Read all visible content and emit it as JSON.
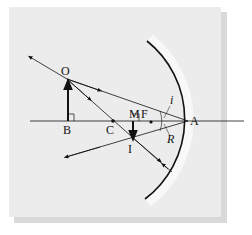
{
  "diagram": {
    "labels": {
      "object_top": "O",
      "object_base": "B",
      "center": "C",
      "image_base": "M",
      "focus": "F",
      "vertex": "A",
      "image_top": "I",
      "incidence_angle": "i",
      "reflection_angle": "R"
    },
    "colors": {
      "panel": "#ececec",
      "shadow": "#d9d9d9",
      "mirror_band": "#f7f7f7",
      "ink": "#111111"
    }
  }
}
